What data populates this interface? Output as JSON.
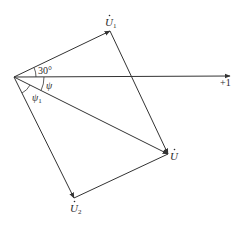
{
  "diagram": {
    "type": "phasor-diagram",
    "colors": {
      "line": "#333333",
      "background": "#ffffff",
      "text": "#2a2a2a"
    },
    "axis": {
      "label": "+1"
    },
    "phasors": [
      {
        "id": "U1",
        "symbol": "U",
        "subscript": "1",
        "label": "U̇1"
      },
      {
        "id": "U",
        "symbol": "U",
        "subscript": "",
        "label": "U̇"
      },
      {
        "id": "U2",
        "symbol": "U",
        "subscript": "2",
        "label": "U̇2"
      }
    ],
    "angles": [
      {
        "id": "angle-30",
        "label": "30°"
      },
      {
        "id": "angle-psi",
        "label": "ψ"
      },
      {
        "id": "angle-psi1",
        "symbol": "ψ",
        "subscript": "1",
        "label": "ψ1"
      }
    ]
  }
}
